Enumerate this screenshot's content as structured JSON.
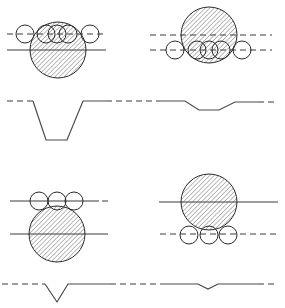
{
  "figure": {
    "colors": {
      "line": "#3a3a3a",
      "hatch": "#555555",
      "background": "#ffffff"
    },
    "panels": [
      {
        "id": "top-left",
        "big_circle": {
          "cx": 58,
          "cy": 50,
          "r": 28,
          "hatched": true
        },
        "small_circles": [
          {
            "cx": 25,
            "cy": 34,
            "r": 9
          },
          {
            "cx": 46,
            "cy": 34,
            "r": 9
          },
          {
            "cx": 57,
            "cy": 34,
            "r": 9
          },
          {
            "cx": 68,
            "cy": 34,
            "r": 9
          },
          {
            "cx": 90,
            "cy": 34,
            "r": 9
          }
        ],
        "lines": [
          {
            "type": "dashed",
            "x1": 7,
            "y1": 34,
            "x2": 107,
            "y2": 34
          },
          {
            "type": "solid",
            "x1": 7,
            "y1": 50,
            "x2": 106,
            "y2": 50
          }
        ]
      },
      {
        "id": "top-right",
        "big_circle": {
          "cx": 209,
          "cy": 35,
          "r": 28,
          "hatched": true
        },
        "small_circles": [
          {
            "cx": 175,
            "cy": 50,
            "r": 9
          },
          {
            "cx": 197,
            "cy": 50,
            "r": 9
          },
          {
            "cx": 209,
            "cy": 50,
            "r": 9
          },
          {
            "cx": 221,
            "cy": 50,
            "r": 9
          },
          {
            "cx": 242,
            "cy": 50,
            "r": 9
          }
        ],
        "lines": [
          {
            "type": "dashed",
            "x1": 150,
            "y1": 35,
            "x2": 272,
            "y2": 35
          },
          {
            "type": "dashed",
            "x1": 150,
            "y1": 50,
            "x2": 272,
            "y2": 50
          }
        ]
      },
      {
        "id": "bottom-left",
        "big_circle": {
          "cx": 57,
          "cy": 234,
          "r": 28,
          "hatched": true
        },
        "small_circles": [
          {
            "cx": 39,
            "cy": 201,
            "r": 9
          },
          {
            "cx": 57,
            "cy": 201,
            "r": 9
          },
          {
            "cx": 74,
            "cy": 201,
            "r": 9
          }
        ],
        "lines": [
          {
            "type": "solid",
            "x1": 10,
            "y1": 201,
            "x2": 99,
            "y2": 201
          },
          {
            "type": "dashed",
            "x1": 102,
            "y1": 201,
            "x2": 108,
            "y2": 201
          },
          {
            "type": "solid",
            "x1": 10,
            "y1": 234,
            "x2": 108,
            "y2": 234
          }
        ]
      },
      {
        "id": "bottom-right",
        "big_circle": {
          "cx": 209,
          "cy": 202,
          "r": 28,
          "hatched": true
        },
        "small_circles": [
          {
            "cx": 189,
            "cy": 235,
            "r": 9
          },
          {
            "cx": 209,
            "cy": 235,
            "r": 9
          },
          {
            "cx": 228,
            "cy": 235,
            "r": 9
          }
        ],
        "lines": [
          {
            "type": "solid",
            "x1": 159,
            "y1": 202,
            "x2": 278,
            "y2": 202
          },
          {
            "type": "dashed",
            "x1": 160,
            "y1": 234,
            "x2": 278,
            "y2": 234
          }
        ]
      }
    ],
    "profiles": [
      {
        "id": "profile-top",
        "segments": [
          {
            "type": "dashed",
            "points": "7,101 33,101"
          },
          {
            "type": "solid",
            "points": "33,101 46,140 67,140 83,101 106,101"
          },
          {
            "type": "dashed",
            "points": "106,101 160,101"
          },
          {
            "type": "solid",
            "points": "160,101 185,101 199,110 219,110 235,102 258,102"
          },
          {
            "type": "dashed",
            "points": "258,102 276,102"
          }
        ]
      },
      {
        "id": "profile-bottom",
        "segments": [
          {
            "type": "dashed",
            "points": "2,284 45,284"
          },
          {
            "type": "solid",
            "points": "45,284 57,302 68,284 110,284"
          },
          {
            "type": "dashed",
            "points": "110,284 160,284"
          },
          {
            "type": "solid",
            "points": "160,284 198,284 208,289 218,284 258,284"
          },
          {
            "type": "dashed",
            "points": "258,284 276,284"
          }
        ]
      }
    ]
  }
}
